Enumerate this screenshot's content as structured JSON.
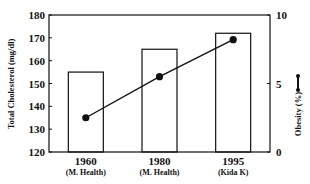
{
  "chart_data": {
    "type": "bar+line",
    "title": "",
    "categories": [
      "1960",
      "1980",
      "1995"
    ],
    "category_sources": [
      "(M. Health)",
      "(M. Health)",
      "(Kida K)"
    ],
    "series": [
      {
        "name": "Total Cholesterol (mg/dl)",
        "type": "bar",
        "axis": "left",
        "values": [
          155,
          165,
          172
        ]
      },
      {
        "name": "Obesity (%)",
        "type": "line",
        "axis": "right",
        "marker": "filled-circle",
        "values": [
          2.5,
          5.5,
          8.2
        ]
      }
    ],
    "ylabel": "Total Cholesterol (mg/dl)",
    "ylim": [
      120,
      180
    ],
    "yticks": [
      120,
      130,
      140,
      150,
      160,
      170,
      180
    ],
    "y2label": "Obesity (%)",
    "y2lim": [
      0,
      10
    ],
    "y2ticks": [
      0,
      5,
      10
    ],
    "xlabel": "",
    "grid": false,
    "legend": "inline marker in right axis label"
  },
  "colors": {
    "axis": "#111111",
    "bar_fill": "#ffffff",
    "bar_stroke": "#111111",
    "line": "#111111"
  }
}
